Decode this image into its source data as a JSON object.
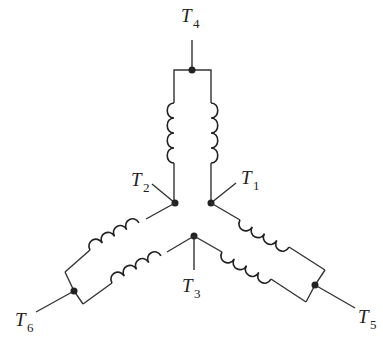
{
  "diagram": {
    "type": "wye-connected dual-winding terminal diagram",
    "terminals": [
      {
        "id": "T1",
        "letter": "T",
        "sub": "1"
      },
      {
        "id": "T2",
        "letter": "T",
        "sub": "2"
      },
      {
        "id": "T3",
        "letter": "T",
        "sub": "3"
      },
      {
        "id": "T4",
        "letter": "T",
        "sub": "4"
      },
      {
        "id": "T5",
        "letter": "T",
        "sub": "5"
      },
      {
        "id": "T6",
        "letter": "T",
        "sub": "6"
      }
    ],
    "colors": {
      "line": "#333333",
      "background": "#ffffff"
    }
  }
}
